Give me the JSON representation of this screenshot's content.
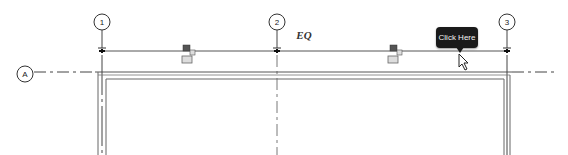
{
  "drawing": {
    "grid_bubbles": {
      "vertical": [
        {
          "label": "1",
          "x": 102
        },
        {
          "label": "2",
          "x": 277
        },
        {
          "label": "3",
          "x": 507
        }
      ],
      "horizontal": [
        {
          "label": "A",
          "y": 71
        }
      ]
    },
    "dimension": {
      "label": "EQ"
    },
    "tooltip": {
      "text": "Click Here"
    },
    "colors": {
      "line": "#555555",
      "wall": "#666666",
      "tooltip_bg": "#1a1a1a"
    }
  }
}
